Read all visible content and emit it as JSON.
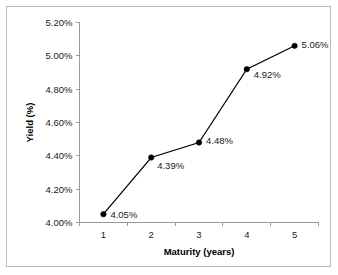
{
  "chart_data": {
    "type": "line",
    "title": "",
    "xlabel": "Maturity (years)",
    "ylabel": "Yield (%)",
    "categories": [
      "1",
      "2",
      "3",
      "4",
      "5"
    ],
    "values": [
      4.05,
      4.39,
      4.48,
      4.92,
      5.06
    ],
    "point_labels": [
      "4.05%",
      "4.39%",
      "4.48%",
      "4.92%",
      "5.06%"
    ],
    "ylim": [
      4.0,
      5.2
    ],
    "ytick_values": [
      4.0,
      4.2,
      4.4,
      4.6,
      4.8,
      5.0,
      5.2
    ],
    "ytick_labels": [
      "4.00%",
      "4.20%",
      "4.40%",
      "4.60%",
      "4.80%",
      "5.00%",
      "5.20%"
    ],
    "grid": false,
    "legend": false,
    "legend_position": "none",
    "marker": "filled-circle",
    "line_color": "#000000",
    "marker_color": "#000000",
    "axis_color": "#9a9a9a",
    "border_color": "#b9b9b9",
    "background_color": "#ffffff"
  }
}
